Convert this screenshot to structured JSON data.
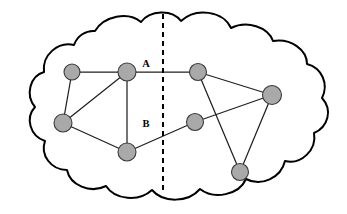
{
  "figure": {
    "background_color": "#ffffff",
    "width": 347,
    "height": 214
  },
  "cloud": {
    "name": "network-cloud",
    "stroke_color": "#000000",
    "fill_color": "#ffffff",
    "stroke_width": 2
  },
  "partition": {
    "name": "partition-divider",
    "style": "dashed",
    "orientation": "vertical",
    "x": 163,
    "y_top": 14,
    "y_bottom": 192,
    "color": "#000000"
  },
  "labels": [
    {
      "id": "A",
      "text": "A",
      "x": 146,
      "y": 65
    },
    {
      "id": "B",
      "text": "B",
      "x": 146,
      "y": 125
    }
  ],
  "graph": {
    "node_fill": "#a9a9a9",
    "node_stroke": "#3a3a3a",
    "node_radius": 8,
    "edge_color": "#231f20",
    "nodes": [
      {
        "id": "n1",
        "cx": 72,
        "cy": 72,
        "r": 8,
        "side": "left"
      },
      {
        "id": "n2",
        "cx": 127,
        "cy": 72,
        "r": 9,
        "side": "left"
      },
      {
        "id": "n3",
        "cx": 63,
        "cy": 123,
        "r": 9,
        "side": "left"
      },
      {
        "id": "n4",
        "cx": 127,
        "cy": 152,
        "r": 9,
        "side": "left"
      },
      {
        "id": "n5",
        "cx": 198,
        "cy": 72,
        "r": 8.5,
        "side": "right"
      },
      {
        "id": "n6",
        "cx": 272,
        "cy": 95,
        "r": 9.5,
        "side": "right"
      },
      {
        "id": "n7",
        "cx": 195,
        "cy": 122,
        "r": 8.5,
        "side": "right"
      },
      {
        "id": "n8",
        "cx": 240,
        "cy": 172,
        "r": 8.5,
        "side": "right"
      }
    ],
    "edges": [
      {
        "id": "e1",
        "from": "n1",
        "to": "n2",
        "label": null
      },
      {
        "id": "e2",
        "from": "n1",
        "to": "n3",
        "label": null
      },
      {
        "id": "e3",
        "from": "n3",
        "to": "n2",
        "label": null
      },
      {
        "id": "e4",
        "from": "n2",
        "to": "n4",
        "label": null
      },
      {
        "id": "e5",
        "from": "n3",
        "to": "n4",
        "label": null
      },
      {
        "id": "e6",
        "from": "n2",
        "to": "n5",
        "label": "A"
      },
      {
        "id": "e7",
        "from": "n4",
        "to": "n7",
        "label": "B"
      },
      {
        "id": "e8",
        "from": "n5",
        "to": "n6",
        "label": null
      },
      {
        "id": "e9",
        "from": "n5",
        "to": "n8",
        "label": null
      },
      {
        "id": "e10",
        "from": "n7",
        "to": "n6",
        "label": null
      },
      {
        "id": "e11",
        "from": "n6",
        "to": "n8",
        "label": null
      }
    ]
  }
}
